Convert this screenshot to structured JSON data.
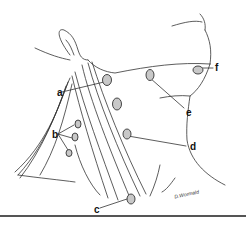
{
  "figure": {
    "type": "anatomical-illustration",
    "labels": [
      {
        "id": "a",
        "text": "a",
        "x": 57,
        "y": 88
      },
      {
        "id": "b",
        "text": "b",
        "x": 52,
        "y": 130
      },
      {
        "id": "c",
        "text": "c",
        "x": 94,
        "y": 205
      },
      {
        "id": "d",
        "text": "d",
        "x": 190,
        "y": 142
      },
      {
        "id": "e",
        "text": "e",
        "x": 186,
        "y": 108
      },
      {
        "id": "f",
        "text": "f",
        "x": 215,
        "y": 66
      }
    ],
    "signature": "D.Wormald",
    "colors": {
      "line": "#333333",
      "node_fill": "#c8c8c8",
      "background": "#ffffff"
    }
  }
}
